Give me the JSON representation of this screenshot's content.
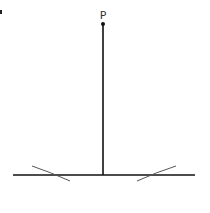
{
  "diagram": {
    "title": "",
    "point": {
      "label": "P",
      "x": 103,
      "y": 24
    },
    "line": {
      "x1": 13,
      "y1": 175,
      "x2": 195,
      "y2": 175
    },
    "perpendicular": {
      "x1": 103,
      "y1": 24,
      "x2": 103,
      "y2": 175
    },
    "arcs": [
      {
        "side": "left",
        "from": [
          32,
          166
        ],
        "to": [
          70,
          181
        ]
      },
      {
        "side": "right",
        "from": [
          137,
          181
        ],
        "to": [
          176,
          166
        ]
      }
    ],
    "colors": {
      "line": "#111111",
      "arc": "#555555",
      "label": "#333333"
    }
  }
}
